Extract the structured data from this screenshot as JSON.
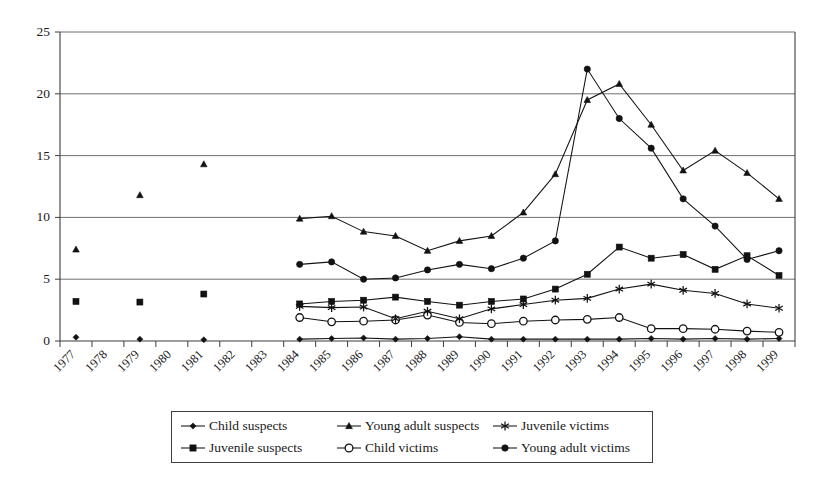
{
  "chart_data": {
    "type": "line",
    "title": "",
    "xlabel": "",
    "ylabel": "",
    "ylim": [
      0,
      25
    ],
    "yticks": [
      0,
      5,
      10,
      15,
      20,
      25
    ],
    "grid": true,
    "legend_position": "bottom",
    "categories": [
      "1977",
      "1978",
      "1979",
      "1980",
      "1981",
      "1982",
      "1983",
      "1984",
      "1985",
      "1986",
      "1987",
      "1988",
      "1989",
      "1990",
      "1991",
      "1992",
      "1993",
      "1994",
      "1995",
      "1996",
      "1997",
      "1998",
      "1999"
    ],
    "series": [
      {
        "name": "Child suspects",
        "marker": "diamond",
        "values": [
          0.3,
          null,
          0.15,
          null,
          0.1,
          null,
          null,
          0.15,
          0.2,
          0.25,
          0.15,
          0.2,
          0.35,
          0.15,
          0.15,
          0.15,
          0.15,
          0.15,
          0.2,
          0.15,
          0.2,
          0.15,
          0.2
        ]
      },
      {
        "name": "Juvenile suspects",
        "marker": "square",
        "values": [
          3.2,
          null,
          3.15,
          null,
          3.8,
          null,
          null,
          3.0,
          3.2,
          3.3,
          3.55,
          3.2,
          2.9,
          3.2,
          3.4,
          4.2,
          5.4,
          7.6,
          6.7,
          7.0,
          5.8,
          6.9,
          5.3
        ]
      },
      {
        "name": "Young adult suspects",
        "marker": "triangle",
        "values": [
          7.4,
          null,
          11.8,
          null,
          14.3,
          null,
          null,
          9.9,
          10.1,
          8.85,
          8.5,
          7.3,
          8.1,
          8.5,
          10.4,
          13.5,
          19.5,
          20.8,
          17.5,
          13.8,
          15.4,
          13.6,
          11.5
        ]
      },
      {
        "name": "Child victims",
        "marker": "circle-open",
        "values": [
          null,
          null,
          null,
          null,
          null,
          null,
          null,
          1.9,
          1.55,
          1.6,
          1.7,
          2.1,
          1.5,
          1.4,
          1.6,
          1.7,
          1.75,
          1.9,
          1.0,
          1.0,
          0.95,
          0.8,
          0.7
        ]
      },
      {
        "name": "Juvenile victims",
        "marker": "star",
        "values": [
          null,
          null,
          null,
          null,
          null,
          null,
          null,
          2.8,
          2.7,
          2.75,
          1.8,
          2.4,
          1.8,
          2.6,
          2.95,
          3.3,
          3.45,
          4.2,
          4.6,
          4.1,
          3.85,
          3.0,
          2.65
        ]
      },
      {
        "name": "Young adult victims",
        "marker": "circle-filled",
        "values": [
          null,
          null,
          null,
          null,
          null,
          null,
          null,
          6.2,
          6.4,
          5.0,
          5.1,
          5.75,
          6.2,
          5.85,
          6.7,
          8.1,
          22.0,
          18.0,
          15.6,
          11.5,
          9.3,
          6.6,
          7.3
        ]
      }
    ]
  },
  "legend": {
    "entries": [
      {
        "label": "Child suspects",
        "marker": "diamond"
      },
      {
        "label": "Juvenile suspects",
        "marker": "square"
      },
      {
        "label": "Young adult suspects",
        "marker": "triangle"
      },
      {
        "label": "Child victims",
        "marker": "circle-open"
      },
      {
        "label": "Juvenile victims",
        "marker": "star"
      },
      {
        "label": "Young adult victims",
        "marker": "circle-filled"
      }
    ]
  },
  "colors": {
    "ink": "#121212",
    "axis": "#3d3d3d",
    "grid": "#6f6f6f",
    "background": "#ffffff"
  }
}
